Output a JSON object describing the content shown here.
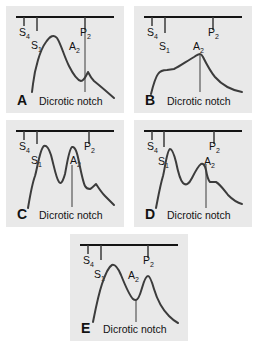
{
  "figure": {
    "background_color": "#ffffff",
    "panel_background_color": "#e9e9e9",
    "trace_color": "#3c3c3c",
    "timeline_color": "#141414",
    "panel_count": 5
  },
  "labels": {
    "s4_base": "S",
    "s4_sub": "4",
    "s1_base": "S",
    "s1_sub": "1",
    "a2_base": "A",
    "a2_sub": "2",
    "p2_base": "P",
    "p2_sub": "2",
    "dicrotic_notch": "Dicrotic notch"
  },
  "panels": [
    {
      "id": "A",
      "letter": "A",
      "caption": "Dicrotic notch",
      "marks": {
        "s4": "S4",
        "s1": "S1",
        "a2": "A2",
        "p2": "P2"
      }
    },
    {
      "id": "B",
      "letter": "B",
      "caption": "Dicrotic notch",
      "marks": {
        "s4": "S4",
        "s1": "S1",
        "a2": "A2",
        "p2": "P2"
      }
    },
    {
      "id": "C",
      "letter": "C",
      "caption": "Dicrotic notch",
      "marks": {
        "s4": "S4",
        "s1": "S1",
        "a2": "A2",
        "p2": "P2"
      }
    },
    {
      "id": "D",
      "letter": "D",
      "caption": "Dicrotic notch",
      "marks": {
        "s4": "S4",
        "s1": "S1",
        "a2": "A2",
        "p2": "P2"
      }
    },
    {
      "id": "E",
      "letter": "E",
      "caption": "Dicrotic notch",
      "marks": {
        "s4": "S4",
        "s1": "S1",
        "a2": "A2",
        "p2": "P2"
      }
    }
  ]
}
